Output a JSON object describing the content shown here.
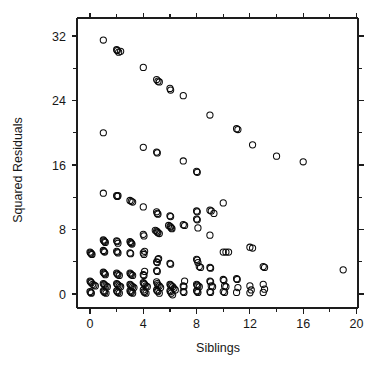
{
  "figure": {
    "background_color": "#ffffff",
    "foreground_color": "#1a1a1a"
  },
  "chart_data": {
    "type": "scatter",
    "title": "",
    "xlabel": "Siblings",
    "ylabel": "Squared Residuals",
    "xlim": [
      -0.9,
      21.3
    ],
    "ylim": [
      -1.6,
      33.4
    ],
    "grid": false,
    "legend": null,
    "marker": "open-circle",
    "marker_color": "#0a0a0a",
    "marker_size": 3.1,
    "xticks": [
      0,
      4,
      8,
      12,
      16,
      20
    ],
    "xticklabels": [
      "0",
      "4",
      "8",
      "12",
      "16",
      "20"
    ],
    "xminorticks": [
      2,
      6,
      10,
      14,
      18
    ],
    "yticks": [
      0,
      8,
      16,
      24,
      32
    ],
    "yticklabels": [
      "0",
      "8",
      "16",
      "24",
      "32"
    ],
    "yminorticks": [
      4,
      12,
      20,
      28
    ],
    "box_axes": true,
    "ticks_direction": "outward",
    "top_axis_ticks": true,
    "right_axis_ticks": true,
    "points": [
      [
        1.0,
        31.5
      ],
      [
        2.0,
        30.3
      ],
      [
        2.05,
        30.2
      ],
      [
        2.15,
        30.0
      ],
      [
        2.3,
        30.1
      ],
      [
        4.0,
        28.1
      ],
      [
        5.0,
        26.6
      ],
      [
        5.1,
        26.4
      ],
      [
        5.2,
        26.3
      ],
      [
        6.0,
        25.5
      ],
      [
        6.05,
        25.3
      ],
      [
        7.0,
        24.6
      ],
      [
        9.0,
        22.2
      ],
      [
        11.0,
        20.5
      ],
      [
        11.1,
        20.4
      ],
      [
        1.0,
        20.0
      ],
      [
        4.0,
        18.2
      ],
      [
        5.0,
        17.6
      ],
      [
        5.05,
        17.5
      ],
      [
        12.2,
        18.5
      ],
      [
        14.0,
        17.1
      ],
      [
        16.0,
        16.4
      ],
      [
        7.0,
        16.5
      ],
      [
        8.0,
        15.2
      ],
      [
        8.05,
        15.1
      ],
      [
        1.0,
        12.5
      ],
      [
        2.0,
        12.2
      ],
      [
        2.05,
        12.1
      ],
      [
        2.1,
        12.2
      ],
      [
        3.0,
        11.6
      ],
      [
        3.1,
        11.5
      ],
      [
        3.2,
        11.4
      ],
      [
        4.0,
        10.8
      ],
      [
        5.0,
        10.2
      ],
      [
        5.05,
        10.0
      ],
      [
        5.1,
        9.9
      ],
      [
        6.0,
        9.7
      ],
      [
        6.05,
        9.6
      ],
      [
        8.0,
        10.3
      ],
      [
        8.05,
        10.2
      ],
      [
        9.0,
        10.4
      ],
      [
        9.1,
        10.3
      ],
      [
        9.3,
        10.0
      ],
      [
        10.0,
        11.3
      ],
      [
        5.9,
        8.5
      ],
      [
        6.0,
        8.4
      ],
      [
        6.05,
        8.3
      ],
      [
        6.1,
        8.2
      ],
      [
        6.15,
        8.1
      ],
      [
        7.0,
        8.6
      ],
      [
        7.1,
        8.5
      ],
      [
        8.0,
        9.3
      ],
      [
        8.05,
        9.2
      ],
      [
        8.1,
        8.2
      ],
      [
        9.0,
        7.3
      ],
      [
        4.9,
        7.9
      ],
      [
        5.0,
        7.8
      ],
      [
        5.05,
        7.7
      ],
      [
        5.1,
        7.6
      ],
      [
        5.2,
        7.5
      ],
      [
        4.0,
        7.4
      ],
      [
        4.05,
        7.2
      ],
      [
        1.0,
        6.7
      ],
      [
        1.05,
        6.6
      ],
      [
        1.1,
        6.5
      ],
      [
        1.15,
        6.4
      ],
      [
        2.0,
        6.6
      ],
      [
        2.05,
        6.5
      ],
      [
        2.1,
        6.3
      ],
      [
        3.0,
        6.5
      ],
      [
        3.05,
        6.4
      ],
      [
        3.1,
        6.3
      ],
      [
        3.15,
        6.2
      ],
      [
        0.0,
        5.2
      ],
      [
        0.05,
        5.1
      ],
      [
        0.1,
        5.0
      ],
      [
        0.15,
        4.9
      ],
      [
        1.0,
        5.4
      ],
      [
        1.05,
        5.3
      ],
      [
        1.1,
        5.2
      ],
      [
        2.0,
        5.3
      ],
      [
        2.05,
        5.2
      ],
      [
        2.1,
        5.1
      ],
      [
        3.0,
        5.1
      ],
      [
        3.05,
        5.0
      ],
      [
        4.0,
        5.1
      ],
      [
        4.05,
        4.9
      ],
      [
        4.1,
        5.3
      ],
      [
        10.0,
        5.2
      ],
      [
        10.2,
        5.2
      ],
      [
        10.4,
        5.2
      ],
      [
        12.0,
        5.8
      ],
      [
        12.2,
        5.7
      ],
      [
        5.0,
        4.0
      ],
      [
        5.05,
        3.9
      ],
      [
        5.1,
        4.3
      ],
      [
        5.15,
        4.4
      ],
      [
        6.0,
        3.8
      ],
      [
        6.05,
        3.7
      ],
      [
        8.0,
        4.3
      ],
      [
        8.05,
        4.2
      ],
      [
        8.1,
        3.9
      ],
      [
        8.2,
        3.4
      ],
      [
        8.3,
        3.3
      ],
      [
        9.0,
        3.3
      ],
      [
        9.05,
        3.2
      ],
      [
        13.0,
        3.4
      ],
      [
        13.1,
        3.3
      ],
      [
        19.0,
        3.0
      ],
      [
        1.0,
        2.7
      ],
      [
        1.05,
        2.6
      ],
      [
        1.1,
        2.5
      ],
      [
        1.15,
        2.4
      ],
      [
        2.0,
        2.6
      ],
      [
        2.05,
        2.5
      ],
      [
        2.1,
        2.4
      ],
      [
        2.2,
        2.3
      ],
      [
        3.0,
        2.6
      ],
      [
        3.05,
        2.5
      ],
      [
        3.1,
        2.4
      ],
      [
        3.2,
        2.3
      ],
      [
        4.0,
        2.4
      ],
      [
        4.05,
        2.3
      ],
      [
        4.1,
        2.8
      ],
      [
        5.0,
        2.9
      ],
      [
        5.05,
        2.8
      ],
      [
        0.0,
        1.6
      ],
      [
        0.05,
        1.5
      ],
      [
        0.1,
        1.4
      ],
      [
        0.2,
        1.2
      ],
      [
        0.3,
        1.1
      ],
      [
        0.4,
        1.0
      ],
      [
        1.0,
        1.3
      ],
      [
        1.05,
        1.2
      ],
      [
        1.1,
        1.1
      ],
      [
        1.2,
        1.0
      ],
      [
        1.3,
        0.9
      ],
      [
        2.0,
        1.3
      ],
      [
        2.05,
        1.2
      ],
      [
        2.1,
        1.1
      ],
      [
        2.2,
        1.0
      ],
      [
        2.3,
        0.9
      ],
      [
        3.0,
        1.2
      ],
      [
        3.05,
        1.1
      ],
      [
        3.1,
        1.0
      ],
      [
        3.2,
        0.9
      ],
      [
        3.3,
        0.8
      ],
      [
        4.0,
        1.4
      ],
      [
        4.05,
        1.3
      ],
      [
        4.1,
        1.2
      ],
      [
        4.2,
        1.0
      ],
      [
        4.3,
        0.9
      ],
      [
        5.0,
        1.5
      ],
      [
        5.05,
        1.3
      ],
      [
        5.1,
        1.1
      ],
      [
        5.2,
        1.0
      ],
      [
        5.3,
        0.8
      ],
      [
        6.0,
        1.2
      ],
      [
        6.05,
        1.1
      ],
      [
        6.1,
        1.0
      ],
      [
        6.2,
        0.9
      ],
      [
        6.3,
        0.7
      ],
      [
        6.4,
        0.5
      ],
      [
        7.0,
        1.0
      ],
      [
        7.05,
        0.9
      ],
      [
        7.1,
        1.6
      ],
      [
        8.0,
        1.2
      ],
      [
        8.05,
        1.1
      ],
      [
        8.1,
        1.0
      ],
      [
        8.2,
        0.9
      ],
      [
        9.0,
        1.6
      ],
      [
        9.05,
        1.5
      ],
      [
        9.1,
        1.0
      ],
      [
        9.2,
        0.9
      ],
      [
        10.0,
        1.8
      ],
      [
        10.05,
        1.7
      ],
      [
        10.1,
        1.0
      ],
      [
        10.2,
        0.9
      ],
      [
        11.0,
        1.9
      ],
      [
        11.05,
        1.8
      ],
      [
        11.1,
        0.8
      ],
      [
        12.0,
        1.0
      ],
      [
        12.1,
        0.5
      ],
      [
        13.0,
        1.2
      ],
      [
        13.1,
        0.6
      ],
      [
        0.0,
        0.3
      ],
      [
        0.05,
        0.2
      ],
      [
        0.1,
        0.1
      ],
      [
        1.0,
        0.4
      ],
      [
        1.05,
        0.3
      ],
      [
        1.1,
        0.2
      ],
      [
        1.2,
        0.1
      ],
      [
        2.0,
        0.4
      ],
      [
        2.05,
        0.3
      ],
      [
        2.1,
        0.2
      ],
      [
        2.2,
        0.1
      ],
      [
        3.0,
        0.4
      ],
      [
        3.05,
        0.3
      ],
      [
        3.1,
        0.2
      ],
      [
        3.2,
        0.1
      ],
      [
        4.0,
        0.5
      ],
      [
        4.05,
        0.3
      ],
      [
        4.1,
        0.2
      ],
      [
        4.2,
        0.1
      ],
      [
        5.0,
        0.5
      ],
      [
        5.05,
        0.4
      ],
      [
        5.1,
        0.3
      ],
      [
        5.2,
        0.1
      ],
      [
        6.0,
        0.4
      ],
      [
        6.05,
        0.3
      ],
      [
        6.1,
        0.1
      ],
      [
        6.2,
        -0.1
      ],
      [
        7.0,
        0.3
      ],
      [
        7.05,
        0.2
      ],
      [
        8.0,
        0.4
      ],
      [
        8.05,
        0.3
      ],
      [
        8.1,
        0.2
      ],
      [
        9.0,
        0.3
      ],
      [
        9.05,
        0.2
      ],
      [
        10.0,
        0.3
      ],
      [
        10.1,
        0.2
      ],
      [
        11.0,
        0.2
      ],
      [
        12.0,
        0.15
      ],
      [
        13.0,
        0.2
      ]
    ]
  }
}
